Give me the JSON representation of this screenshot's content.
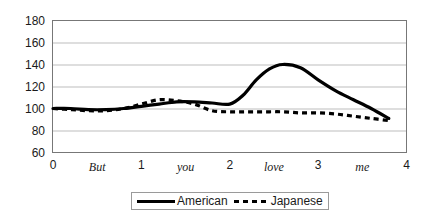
{
  "chart_data": {
    "type": "line",
    "title": "",
    "xlabel": "",
    "ylabel": "",
    "xlim": [
      0,
      4
    ],
    "ylim": [
      60,
      180
    ],
    "ytick_labels": [
      "180",
      "160",
      "140",
      "120",
      "100",
      "80",
      "60"
    ],
    "yticks": [
      180,
      160,
      140,
      120,
      100,
      80,
      60
    ],
    "xtick_labels": [
      "0",
      "But",
      "1",
      "you",
      "2",
      "love",
      "3",
      "me",
      "4"
    ],
    "xticks": [
      0,
      0.5,
      1,
      1.5,
      2,
      2.5,
      3,
      3.5,
      4
    ],
    "grid": "horizontal",
    "legend_position": "bottom-center",
    "series": [
      {
        "name": "American",
        "style": "solid",
        "color": "#000000",
        "x": [
          0.0,
          0.2,
          0.4,
          0.6,
          0.8,
          1.0,
          1.2,
          1.4,
          1.6,
          1.8,
          2.0,
          2.15,
          2.3,
          2.45,
          2.6,
          2.8,
          3.0,
          3.2,
          3.4,
          3.6,
          3.8
        ],
        "values": [
          100,
          100,
          99,
          99,
          100,
          102,
          104,
          106,
          106,
          105,
          104,
          112,
          126,
          136,
          140,
          137,
          126,
          116,
          108,
          100,
          91
        ]
      },
      {
        "name": "Japanese",
        "style": "dashed",
        "color": "#000000",
        "x": [
          0.0,
          0.2,
          0.4,
          0.6,
          0.8,
          1.0,
          1.2,
          1.4,
          1.6,
          1.8,
          2.0,
          2.2,
          2.4,
          2.6,
          2.8,
          3.0,
          3.2,
          3.4,
          3.6,
          3.8
        ],
        "values": [
          100,
          99,
          98,
          98,
          100,
          104,
          108,
          107,
          104,
          98,
          97,
          97,
          97,
          97,
          96,
          96,
          95,
          93,
          91,
          89
        ]
      }
    ]
  },
  "legend": {
    "american_label": "American",
    "japanese_label": "Japanese"
  }
}
